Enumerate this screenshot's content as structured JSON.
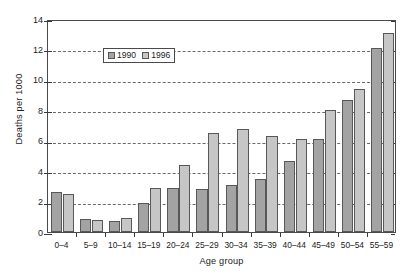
{
  "chart_data": {
    "type": "bar",
    "title": "",
    "subtitle": "",
    "xlabel": "Age group",
    "ylabel": "Deaths per 1000",
    "ylim": [
      0,
      14
    ],
    "ytick_labels": [
      "0",
      "2",
      "4",
      "6",
      "8",
      "10",
      "12",
      "14"
    ],
    "ytick_values": [
      0,
      2,
      4,
      6,
      8,
      10,
      12,
      14
    ],
    "gridlines": [
      2,
      4,
      6,
      8,
      10,
      12
    ],
    "grid": true,
    "legend_position": "top-left inside",
    "categories": [
      "0–4",
      "5–9",
      "10–14",
      "15–19",
      "20–24",
      "25–29",
      "30–34",
      "35–39",
      "40–44",
      "45–49",
      "50–54",
      "55–59"
    ],
    "series": [
      {
        "name": "1990",
        "color": "#a3a3a3",
        "values": [
          2.6,
          0.85,
          0.7,
          1.9,
          2.9,
          2.8,
          3.1,
          3.5,
          4.7,
          6.1,
          8.7,
          12.1
        ]
      },
      {
        "name": "1996",
        "color": "#c6c6c6",
        "values": [
          2.5,
          0.8,
          0.9,
          2.9,
          4.4,
          6.5,
          6.8,
          6.3,
          6.1,
          8.0,
          9.4,
          13.1
        ]
      }
    ]
  },
  "legend": {
    "entries": [
      {
        "label": "1990",
        "swatch": "legend-swatch-1990"
      },
      {
        "label": "1996",
        "swatch": "legend-swatch-1996"
      }
    ]
  },
  "axes": {
    "y_title": "Deaths per 1000",
    "x_title": "Age group"
  }
}
